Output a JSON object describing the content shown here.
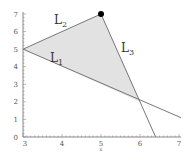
{
  "chart_data": {
    "type": "line",
    "title": "",
    "xlabel": "x",
    "ylabel": "",
    "xlim": [
      3,
      7
    ],
    "ylim": [
      0,
      7
    ],
    "x_ticks": [
      3,
      4,
      5,
      6,
      7
    ],
    "y_ticks": [
      0,
      1,
      2,
      3,
      4,
      5,
      6,
      7
    ],
    "x_tick_labels": [
      "3",
      "4",
      "5",
      "6",
      "7"
    ],
    "y_tick_labels": [
      "0",
      "1",
      "2",
      "3",
      "4",
      "5",
      "6",
      "7"
    ],
    "grid": false,
    "series": [
      {
        "name": "L1",
        "label_main": "L",
        "label_sub": "1",
        "points": [
          [
            3,
            5
          ],
          [
            7.05,
            1.1
          ]
        ]
      },
      {
        "name": "L2",
        "label_main": "L",
        "label_sub": "2",
        "points": [
          [
            3,
            5
          ],
          [
            5,
            7
          ]
        ]
      },
      {
        "name": "L3",
        "label_main": "L",
        "label_sub": "3",
        "points": [
          [
            5,
            7
          ],
          [
            6.4,
            0
          ]
        ]
      }
    ],
    "shaded_region": {
      "vertices": [
        [
          3,
          5
        ],
        [
          5,
          7
        ],
        [
          6,
          2
        ]
      ],
      "color": "#e2e2e2"
    },
    "highlight_point": {
      "x": 5,
      "y": 7,
      "color": "#000000"
    },
    "line_color": "#777777",
    "axis_color": "#888888"
  }
}
